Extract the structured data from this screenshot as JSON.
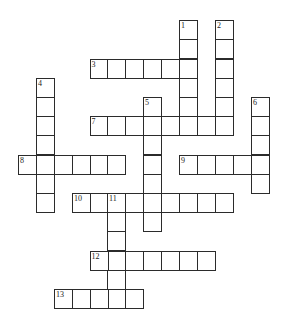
{
  "puzzle": {
    "cell_width": 18,
    "cell_height": 19.2,
    "col_x": [
      18,
      36,
      54,
      72,
      89.5,
      107,
      125,
      143,
      161,
      179,
      197,
      215,
      233,
      251
    ],
    "row_y": [
      20,
      39,
      58.5,
      77.5,
      97,
      116,
      135,
      154.5,
      173.5,
      193,
      212,
      231,
      251,
      270,
      289
    ],
    "line_color": "#2b2b2b",
    "words": [
      {
        "number": "1",
        "direction": "down",
        "row": 0,
        "col": 9,
        "length": 6
      },
      {
        "number": "2",
        "direction": "down",
        "row": 0,
        "col": 11,
        "length": 6
      },
      {
        "number": "3",
        "direction": "across",
        "row": 2,
        "col": 4,
        "length": 6
      },
      {
        "number": "4",
        "direction": "down",
        "row": 3,
        "col": 1,
        "length": 7
      },
      {
        "number": "5",
        "direction": "down",
        "row": 4,
        "col": 7,
        "length": 7
      },
      {
        "number": "6",
        "direction": "down",
        "row": 4,
        "col": 13,
        "length": 5
      },
      {
        "number": "7",
        "direction": "across",
        "row": 5,
        "col": 4,
        "length": 8
      },
      {
        "number": "8",
        "direction": "across",
        "row": 7,
        "col": 0,
        "length": 6
      },
      {
        "number": "9",
        "direction": "across",
        "row": 7,
        "col": 9,
        "length": 5
      },
      {
        "number": "10",
        "direction": "across",
        "row": 9,
        "col": 3,
        "length": 9
      },
      {
        "number": "11",
        "direction": "down",
        "row": 9,
        "col": 5,
        "length": 6
      },
      {
        "number": "12",
        "direction": "across",
        "row": 12,
        "col": 4,
        "length": 7
      },
      {
        "number": "13",
        "direction": "across",
        "row": 14,
        "col": 2,
        "length": 5
      }
    ]
  }
}
